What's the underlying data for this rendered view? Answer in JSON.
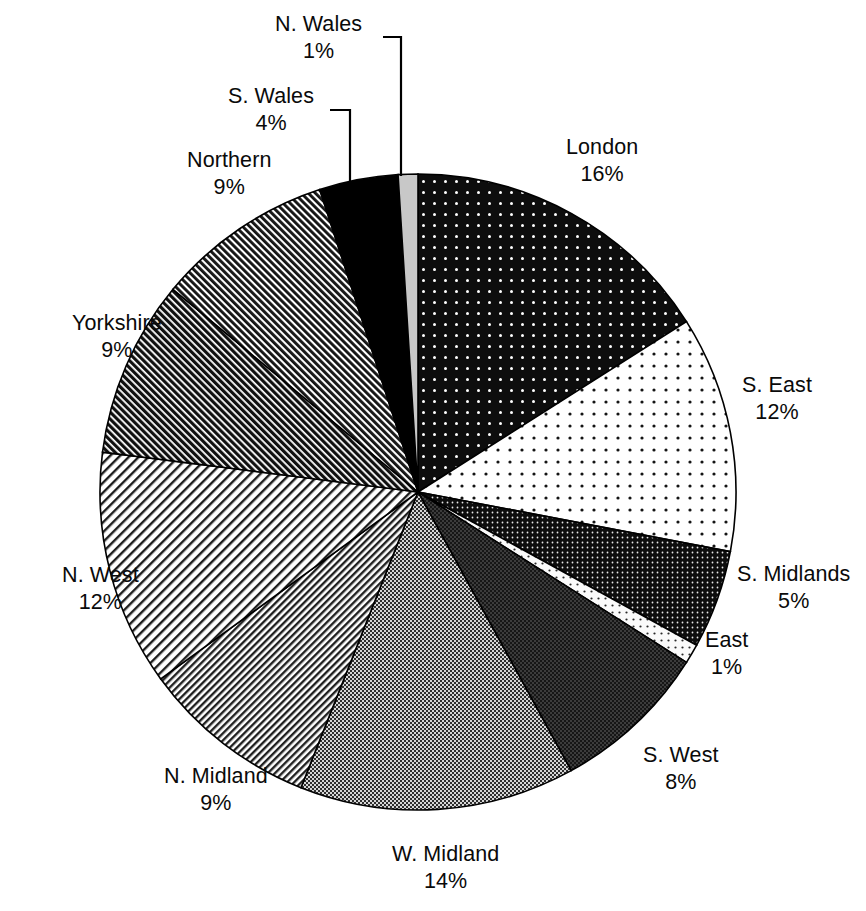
{
  "chart_data": {
    "type": "pie",
    "title": "",
    "subtitle": "",
    "xlabel": "",
    "ylabel": "",
    "legend_position": "none",
    "grid": false,
    "units": "percent",
    "start_angle_deg": 0,
    "direction": "clockwise",
    "total": 100,
    "categories": [
      "London",
      "S. East",
      "S. Midlands",
      "East",
      "S. West",
      "W. Midland",
      "N. Midland",
      "N. West",
      "Yorkshire",
      "Northern",
      "S. Wales",
      "N. Wales"
    ],
    "values": [
      16,
      12,
      5,
      1,
      8,
      14,
      9,
      12,
      9,
      9,
      4,
      1
    ],
    "value_labels": [
      "16%",
      "12%",
      "5%",
      "1%",
      "8%",
      "14%",
      "9%",
      "12%",
      "9%",
      "9%",
      "4%",
      "1%"
    ],
    "slices": [
      {
        "name": "London",
        "value": 16,
        "value_label": "16%",
        "fill": "black-with-white-dots",
        "fill_color": "#0d0d0d",
        "label_x": 566,
        "label_y": 134,
        "align": "left",
        "leader": false
      },
      {
        "name": "S. East",
        "value": 12,
        "value_label": "12%",
        "fill": "white-with-black-dots",
        "fill_color": "#fdfdfd",
        "label_x": 742,
        "label_y": 372,
        "align": "left",
        "leader": false
      },
      {
        "name": "S. Midlands",
        "value": 5,
        "value_label": "5%",
        "fill": "dark-dense-weave",
        "fill_color": "#121212",
        "label_x": 737,
        "label_y": 561,
        "align": "left",
        "leader": false
      },
      {
        "name": "East",
        "value": 1,
        "value_label": "1%",
        "fill": "light-sparse-dots",
        "fill_color": "#f0f0f0",
        "label_x": 705,
        "label_y": 627,
        "align": "left",
        "leader": false
      },
      {
        "name": "S. West",
        "value": 8,
        "value_label": "8%",
        "fill": "dark-grey-crosshatch",
        "fill_color": "#3a3a3a",
        "label_x": 643,
        "label_y": 742,
        "align": "left",
        "leader": false
      },
      {
        "name": "W. Midland",
        "value": 14,
        "value_label": "14%",
        "fill": "mid-grey-checker",
        "fill_color": "#8d8d8d",
        "label_x": 392,
        "label_y": 841,
        "align": "center",
        "leader": false
      },
      {
        "name": "N. Midland",
        "value": 9,
        "value_label": "9%",
        "fill": "fine-diagonal-hatch",
        "fill_color": "#bdbdbd",
        "label_x": 164,
        "label_y": 763,
        "align": "center",
        "leader": false
      },
      {
        "name": "N. West",
        "value": 12,
        "value_label": "12%",
        "fill": "light-diagonal-hatch",
        "fill_color": "#cfcfcf",
        "label_x": 62,
        "label_y": 562,
        "align": "center",
        "leader": false
      },
      {
        "name": "Yorkshire",
        "value": 9,
        "value_label": "9%",
        "fill": "dense-dark-hatch",
        "fill_color": "#5a5a5a",
        "label_x": 72,
        "label_y": 310,
        "align": "center",
        "leader": false
      },
      {
        "name": "Northern",
        "value": 9,
        "value_label": "9%",
        "fill": "medium-dark-hatch",
        "fill_color": "#6e6e6e",
        "label_x": 187,
        "label_y": 147,
        "align": "center",
        "leader": false
      },
      {
        "name": "S. Wales",
        "value": 4,
        "value_label": "4%",
        "fill": "solid-black",
        "fill_color": "#000000",
        "label_x": 228,
        "label_y": 83,
        "align": "center",
        "leader": true
      },
      {
        "name": "N. Wales",
        "value": 1,
        "value_label": "1%",
        "fill": "solid-light-grey",
        "fill_color": "#c8c8c8",
        "label_x": 275,
        "label_y": 11,
        "align": "center",
        "leader": true
      }
    ],
    "leader_lines": [
      {
        "name": "N. Wales",
        "points": "383,37 401,37 401,176"
      },
      {
        "name": "S. Wales",
        "points": "330,110 350,110 350,184"
      }
    ]
  },
  "geometry": {
    "center_x": 418,
    "center_y": 492,
    "radius": 318,
    "stroke_color": "#000000",
    "stroke_width": 1.6,
    "background": "#ffffff"
  }
}
